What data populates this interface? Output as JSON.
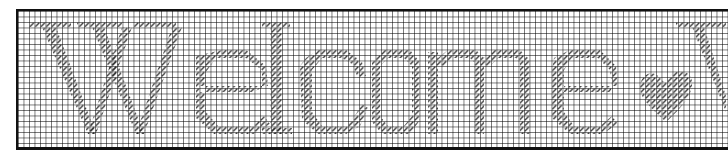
{
  "chart": {
    "motif": "heart",
    "grid_cell_px": 5.5,
    "stitch_color": "#333333",
    "grid_line_color": "#8c8c8c",
    "border_color": "#111111",
    "background_color": "#ffffff"
  },
  "letters": [
    {
      "char": "W",
      "icon": "letter-w-stitched"
    },
    {
      "char": "e",
      "icon": "letter-e-stitched"
    },
    {
      "char": "l",
      "icon": "letter-l-stitched"
    },
    {
      "char": "c",
      "icon": "letter-c-stitched"
    },
    {
      "char": "o",
      "icon": "letter-o-stitched"
    },
    {
      "char": "m",
      "icon": "letter-m-stitched"
    },
    {
      "char": "e",
      "icon": "letter-e-stitched"
    }
  ],
  "decorations": [
    {
      "type": "heart",
      "icon": "heart-icon"
    },
    {
      "type": "partial-letter",
      "icon": "partial-letter-cutoff"
    }
  ]
}
